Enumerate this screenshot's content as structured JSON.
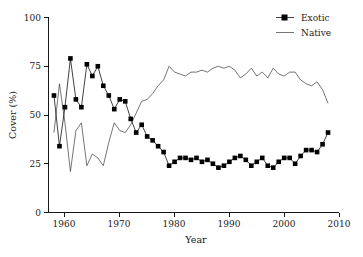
{
  "chart_data": {
    "type": "line",
    "title": "",
    "xlabel": "Year",
    "ylabel": "Cover (%)",
    "xlim": [
      1957,
      2010
    ],
    "ylim": [
      0,
      100
    ],
    "grid": false,
    "legend_position": "top-right",
    "xticks": [
      1960,
      1970,
      1980,
      1990,
      2000,
      2010
    ],
    "yticks": [
      0,
      25,
      50,
      75,
      100
    ],
    "x": [
      1958,
      1959,
      1960,
      1961,
      1962,
      1963,
      1964,
      1965,
      1966,
      1967,
      1968,
      1969,
      1970,
      1971,
      1972,
      1973,
      1974,
      1975,
      1976,
      1977,
      1978,
      1979,
      1980,
      1981,
      1982,
      1983,
      1984,
      1985,
      1986,
      1987,
      1988,
      1989,
      1990,
      1991,
      1992,
      1993,
      1994,
      1995,
      1996,
      1997,
      1998,
      1999,
      2000,
      2001,
      2002,
      2003,
      2004,
      2005,
      2006,
      2007,
      2008
    ],
    "series": [
      {
        "name": "Exotic",
        "marker": "square",
        "color": "#000000",
        "values": [
          60,
          34,
          54,
          79,
          58,
          54,
          76,
          70,
          75,
          65,
          60,
          53,
          58,
          57,
          48,
          41,
          45,
          39,
          37,
          34,
          31,
          24,
          26,
          28,
          28,
          27,
          28,
          26,
          27,
          25,
          23,
          24,
          26,
          28,
          29,
          27,
          24,
          26,
          28,
          24,
          23,
          26,
          28,
          28,
          25,
          29,
          32,
          32,
          31,
          35,
          41
        ]
      },
      {
        "name": "Native",
        "marker": "none",
        "color": "#3a3a3a",
        "values": [
          41,
          66,
          46,
          21,
          42,
          46,
          24,
          30,
          28,
          24,
          36,
          46,
          42,
          41,
          45,
          51,
          57,
          58,
          61,
          65,
          68,
          75,
          72,
          71,
          70,
          72,
          72,
          73,
          72,
          74,
          75,
          74,
          75,
          73,
          69,
          71,
          74,
          70,
          72,
          69,
          74,
          71,
          70,
          72,
          72,
          68,
          66,
          65,
          67,
          63,
          56
        ]
      }
    ]
  },
  "legend": {
    "entries": [
      {
        "label": "Exotic"
      },
      {
        "label": "Native"
      }
    ]
  },
  "axes": {
    "x_label": "Year",
    "y_label": "Cover (%)",
    "x_tick_labels": [
      "1960",
      "1970",
      "1980",
      "1990",
      "2000",
      "2010"
    ],
    "y_tick_labels": [
      "0",
      "25",
      "50",
      "75",
      "100"
    ]
  }
}
